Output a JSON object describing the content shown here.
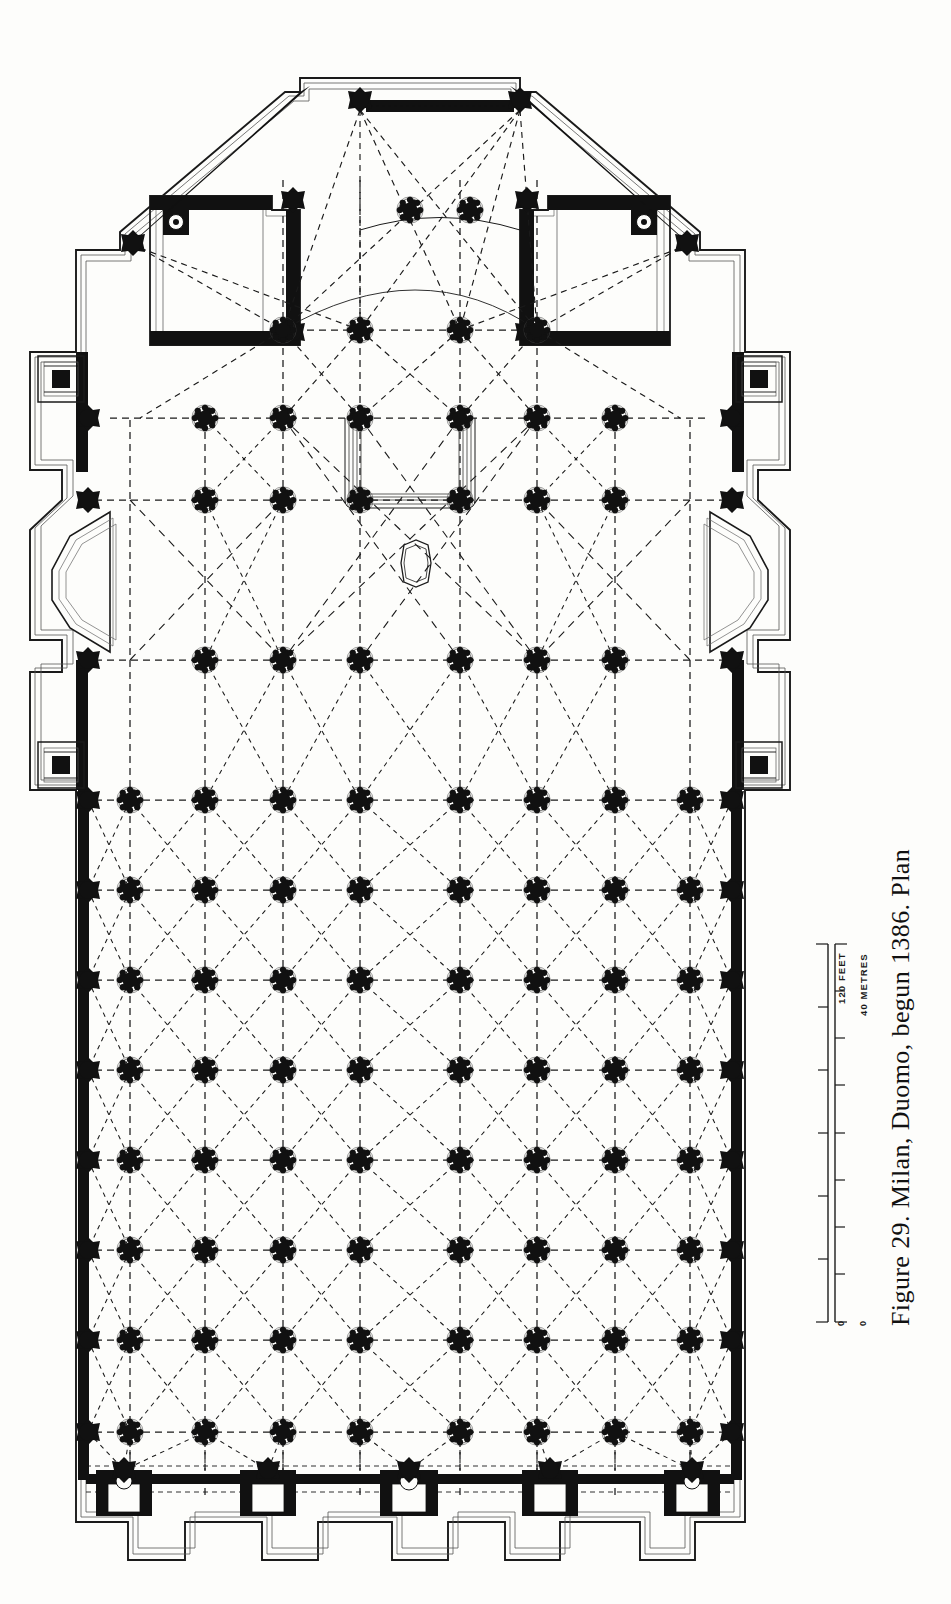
{
  "figure": {
    "caption": "Figure 29. Milan, Duomo, begun 1386. Plan",
    "number": "29",
    "subject": "Milan, Duomo",
    "date_begun": "1386",
    "drawing_type": "Plan"
  },
  "scale": {
    "feet_label": "120 FEET",
    "metres_label": "40 METRES",
    "feet_zero": "0",
    "metres_zero": "0",
    "feet_max": 120,
    "metres_max": 40,
    "feet_tick_interval": 20,
    "metres_tick_interval": 5
  },
  "plan": {
    "ink_color": "#111111",
    "paper_color": "#fdfdfb",
    "rib_color": "#1a1a1a",
    "description": "Five-aisled Gothic cathedral plan with polygonal apse, projecting transepts, clustered piers and dashed vault ribs",
    "nave_bay_columns": 6,
    "nave_bay_rows": 11,
    "aisles": 5,
    "apse_sides": 3,
    "facade_portals": 5,
    "sacristy_count": 2,
    "transept_chapels": 2,
    "corner_towers": 4
  }
}
